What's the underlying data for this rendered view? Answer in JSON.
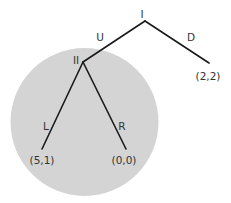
{
  "diagram": {
    "type": "game-tree",
    "colors": {
      "background": "#ffffff",
      "info_set_fill": "#d4d4d4",
      "edge": "#1a1a1a",
      "text": "#333333"
    },
    "information_set": {
      "label": "Player II information set",
      "cx": 84.5,
      "cy": 122,
      "r": 74
    },
    "nodes": [
      {
        "id": "I",
        "label": "I",
        "x": 145,
        "y": 21,
        "label_x": 142,
        "label_y": 18
      },
      {
        "id": "II",
        "label": "II",
        "x": 83,
        "y": 62,
        "label_x": 76,
        "label_y": 64
      }
    ],
    "edges": [
      {
        "id": "U",
        "label": "U",
        "x1": 145,
        "y1": 21,
        "x2": 83,
        "y2": 62,
        "label_x": 100,
        "label_y": 41
      },
      {
        "id": "D",
        "label": "D",
        "x1": 145,
        "y1": 21,
        "x2": 209,
        "y2": 63,
        "label_x": 191,
        "label_y": 41
      },
      {
        "id": "L",
        "label": "L",
        "x1": 83,
        "y1": 62,
        "x2": 42,
        "y2": 149,
        "label_x": 46,
        "label_y": 130
      },
      {
        "id": "R",
        "label": "R",
        "x1": 83,
        "y1": 62,
        "x2": 126,
        "y2": 149,
        "label_x": 122,
        "label_y": 130
      }
    ],
    "payoffs": [
      {
        "id": "UL",
        "label": "(5,1)",
        "x": 42,
        "y": 164
      },
      {
        "id": "UR",
        "label": "(0,0)",
        "x": 124,
        "y": 164
      },
      {
        "id": "D",
        "label": "(2,2)",
        "x": 208,
        "y": 80
      }
    ]
  }
}
